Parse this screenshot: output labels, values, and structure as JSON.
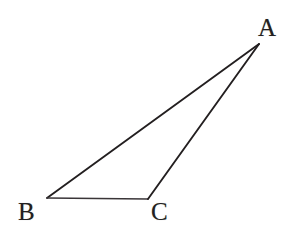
{
  "figure": {
    "kind": "geometry-diagram",
    "shape": "triangle",
    "background_color": "#ffffff",
    "stroke_color": "#231f20",
    "label_color": "#231f20",
    "width": 298,
    "height": 238
  },
  "labels": {
    "a": "A",
    "b": "B",
    "c": "C"
  },
  "chart_data": {
    "type": "scatter",
    "title": "",
    "subtitle": "",
    "xlabel": "",
    "ylabel": "",
    "grid": false,
    "legend": "none",
    "xlim": [
      0,
      298
    ],
    "ylim": [
      0,
      238
    ],
    "annotations": [
      "A",
      "B",
      "C"
    ],
    "vertices": [
      {
        "name": "A",
        "x": 259,
        "y": 44,
        "label": "A",
        "label_x": 268,
        "label_y": 28
      },
      {
        "name": "B",
        "x": 47,
        "y": 198,
        "label": "B",
        "label_x": 28,
        "label_y": 212
      },
      {
        "name": "C",
        "x": 148,
        "y": 199,
        "label": "C",
        "label_x": 161,
        "label_y": 212
      }
    ],
    "edges": [
      {
        "name": "AB",
        "from": "A",
        "to": "B",
        "stroke_width": 1.9,
        "color": "#231f20"
      },
      {
        "name": "BC",
        "from": "B",
        "to": "C",
        "stroke_width": 1.6,
        "color": "#3a3538"
      },
      {
        "name": "CA",
        "from": "C",
        "to": "A",
        "stroke_width": 1.9,
        "color": "#231f20"
      }
    ],
    "polygon_points": "259,44 47,198 148,199"
  }
}
